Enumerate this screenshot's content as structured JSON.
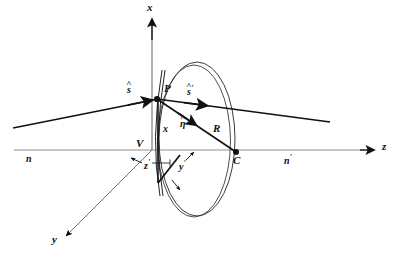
{
  "figure": {
    "type": "optics-ray-diagram",
    "background_color": "#ffffff",
    "ink_color": "#111111",
    "axis_color": "#8a8a8a"
  },
  "axes": {
    "x_label": "x",
    "y_label": "y",
    "z_label": "z",
    "origin_label": "V",
    "x_axis": {
      "from": [
        152,
        150
      ],
      "to": [
        152,
        18
      ],
      "arrow": true
    },
    "z_axis": {
      "from": [
        14,
        150
      ],
      "to": [
        378,
        150
      ],
      "arrow": true
    },
    "y_axis": {
      "from": [
        152,
        150
      ],
      "to": [
        64,
        238
      ],
      "arrow": true
    }
  },
  "local_axes": {
    "z_prime_label": "z",
    "z_prime_prime": "'",
    "y_prime_label": "y",
    "y_prime_prime": "'",
    "x_prime_label": "x"
  },
  "media": {
    "left_index_label": "n",
    "right_index_label": "n",
    "right_index_prime": "'"
  },
  "points": [
    {
      "name": "P",
      "label": "P",
      "x": 157,
      "y": 99,
      "dot": true
    },
    {
      "name": "C",
      "label": "C",
      "x": 236,
      "y": 152,
      "dot": true
    },
    {
      "name": "V",
      "label": "V",
      "x": 152,
      "y": 150,
      "dot": false
    }
  ],
  "vectors": {
    "incident_ray": {
      "label": "s",
      "hat": "^",
      "prime": "",
      "from": [
        13,
        128
      ],
      "to": [
        157,
        99
      ]
    },
    "refracted_ray": {
      "label": "s",
      "hat": "^",
      "prime": "'",
      "from": [
        157,
        99
      ],
      "to": [
        330,
        122
      ]
    },
    "normal": {
      "label": "η",
      "hat": "^",
      "prime": "",
      "from": [
        157,
        99
      ],
      "to": [
        236,
        152
      ]
    },
    "radius": {
      "label": "R",
      "from": [
        157,
        99
      ],
      "to": [
        236,
        152
      ]
    }
  },
  "surface": {
    "shape": "ellipse",
    "center": [
      196,
      139
    ],
    "rx": 38,
    "ry": 77,
    "double_outline": true
  },
  "label_positions": {
    "x_top": [
      147,
      4
    ],
    "z_right": [
      382,
      143
    ],
    "y_bottom": [
      54,
      241
    ],
    "V": [
      138,
      140
    ],
    "P": [
      164,
      86
    ],
    "C": [
      234,
      157
    ],
    "R": [
      214,
      126
    ],
    "eta": [
      182,
      122
    ],
    "s_incident": [
      128,
      87
    ],
    "s_refracted": [
      188,
      87
    ],
    "n_left": [
      27,
      156
    ],
    "n_right": [
      285,
      156
    ],
    "x_local": [
      161,
      126
    ],
    "z_local": [
      144,
      166
    ],
    "y_local": [
      178,
      163
    ]
  }
}
